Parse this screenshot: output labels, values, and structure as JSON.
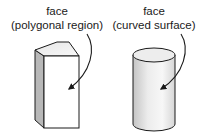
{
  "diagram": {
    "left": {
      "title": "face",
      "subtitle": "(polygonal region)",
      "shape": "rectangular-prism"
    },
    "right": {
      "title": "face",
      "subtitle": "(curved surface)",
      "shape": "cylinder"
    }
  },
  "colors": {
    "stroke": "#1a1a1a",
    "side_shade": "#b5b5b5",
    "cylinder_shade_dark": "#c8c8c8",
    "cylinder_shade_light": "#f4f4f4",
    "background": "#ffffff"
  }
}
